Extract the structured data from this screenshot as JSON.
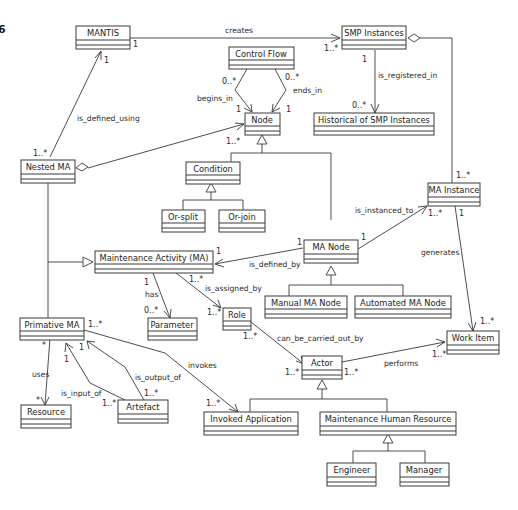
{
  "figure": {
    "number_fragment": "6"
  },
  "classes": {
    "mantis": "MANTIS",
    "smp_instances": "SMP Instances",
    "control_flow": "Control Flow",
    "node": "Node",
    "historical": "Historical of SMP Instances",
    "nested_ma": "Nested MA",
    "condition": "Condition",
    "or_split": "Or-split",
    "or_join": "Or-join",
    "ma_instance": "MA Instance",
    "maintenance_activity": "Maintenance Activity (MA)",
    "ma_node": "MA Node",
    "parameter": "Parameter",
    "role": "Role",
    "manual_ma_node": "Manual MA Node",
    "automated_ma_node": "Automated MA Node",
    "primative_ma": "Primative MA",
    "work_item": "Work Item",
    "actor": "Actor",
    "resource": "Resource",
    "artefact": "Artefact",
    "invoked_application": "Invoked Application",
    "maintenance_human_resource": "Maintenance Human Resource",
    "engineer": "Engineer",
    "manager": "Manager"
  },
  "associations": {
    "creates": {
      "label": "creates",
      "src_mult": "1",
      "dst_mult": "1..*"
    },
    "is_registered_in": {
      "label": "is_registered_in",
      "src_mult": "1",
      "dst_mult": "0..*"
    },
    "begins_in": {
      "label": "begins_in",
      "src_mult": "0..*",
      "dst_mult": "1"
    },
    "ends_in": {
      "label": "ends_in",
      "src_mult": "0..*",
      "dst_mult": "1"
    },
    "is_defined_using": {
      "label": "is_defined_using",
      "src_mult": "1..*",
      "dst_mult": "1"
    },
    "nested_node": {
      "dst_mult": "1..*"
    },
    "smp_ma_instance": {
      "dst_mult": "1..*"
    },
    "is_instanced_to": {
      "label": "is_instanced_to",
      "src_mult": "1",
      "dst_mult": "1..*"
    },
    "is_defined_by": {
      "label": "is_defined_by",
      "src_mult": "1",
      "dst_mult": "1"
    },
    "generates": {
      "label": "generates",
      "src_mult": "1",
      "dst_mult": "1..*"
    },
    "has": {
      "label": "has",
      "src_mult": "1",
      "dst_mult": "0..*"
    },
    "is_assigned_by": {
      "label": "is_assigned_by",
      "src_mult": "1..*",
      "dst_mult": "1..*"
    },
    "can_be_carried_out_by": {
      "label": "can_be_carried_out_by",
      "src_mult": "1..*",
      "dst_mult": "1..*"
    },
    "performs": {
      "label": "performs",
      "src_mult": "1..*",
      "dst_mult": "1..*"
    },
    "invokes": {
      "label": "invokes",
      "src_mult": "1..*",
      "dst_mult": "1..*"
    },
    "uses": {
      "label": "uses",
      "src_mult": "*",
      "dst_mult": "*"
    },
    "is_input_of": {
      "label": "is_input_of",
      "src_mult": "1..*",
      "dst_mult": "1"
    },
    "is_output_of": {
      "label": "is_output_of",
      "src_mult": "1..*",
      "dst_mult": "1"
    }
  }
}
